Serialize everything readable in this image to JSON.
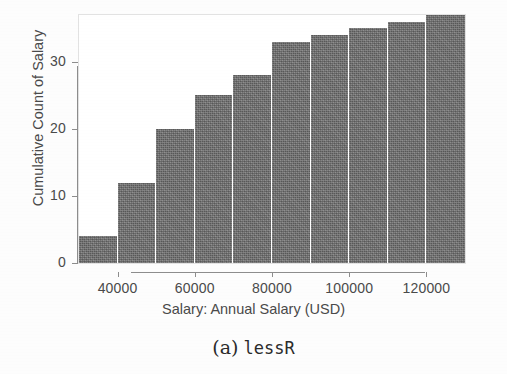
{
  "figure": {
    "caption_label": "(a)",
    "caption_name": "lessR"
  },
  "chart_data": {
    "type": "bar",
    "title": "",
    "subtitle": "",
    "xlabel": "Salary: Annual Salary (USD)",
    "ylabel": "Cumulative Count of Salary",
    "grid": false,
    "legend": "none",
    "xlim": [
      30000,
      130000
    ],
    "ylim": [
      0,
      37
    ],
    "bin_width": 10000,
    "x_tick_labels": [
      "40000",
      "60000",
      "80000",
      "100000",
      "120000"
    ],
    "x_tick_values": [
      40000,
      60000,
      80000,
      100000,
      120000
    ],
    "y_tick_labels": [
      "0",
      "10",
      "20",
      "30"
    ],
    "y_tick_values": [
      0,
      10,
      20,
      30
    ],
    "bar_color": "#6f6f6f",
    "bar_edge_color": "#ffffff",
    "categories": [
      "30000-40000",
      "40000-50000",
      "50000-60000",
      "60000-70000",
      "70000-80000",
      "80000-90000",
      "90000-100000",
      "100000-110000",
      "110000-120000",
      "120000-130000"
    ],
    "bin_starts": [
      30000,
      40000,
      50000,
      60000,
      70000,
      80000,
      90000,
      100000,
      110000,
      120000
    ],
    "bin_ends": [
      40000,
      50000,
      60000,
      70000,
      80000,
      90000,
      100000,
      110000,
      120000,
      130000
    ],
    "values": [
      4,
      12,
      20,
      25,
      28,
      33,
      34,
      35,
      36,
      37
    ]
  }
}
